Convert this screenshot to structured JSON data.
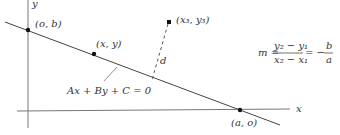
{
  "diagram": {
    "axes": {
      "x_label": "x",
      "y_label": "y"
    },
    "points": {
      "y_intercept": "(o, b)",
      "general_point": "(x, y)",
      "x_intercept": "(a, o)",
      "external_point": "(x₃, y₃)"
    },
    "line_equation": "Ax + By + C = 0",
    "distance_label": "d",
    "slope_formula": {
      "lhs": "m =",
      "numerator": "y₂ − y₁",
      "denominator": "x₂ − x₁",
      "equals": "= −",
      "frac2_numerator": "b",
      "frac2_denominator": "a"
    },
    "colors": {
      "line": "#444444",
      "axis": "#666666",
      "point": "#111111"
    }
  }
}
